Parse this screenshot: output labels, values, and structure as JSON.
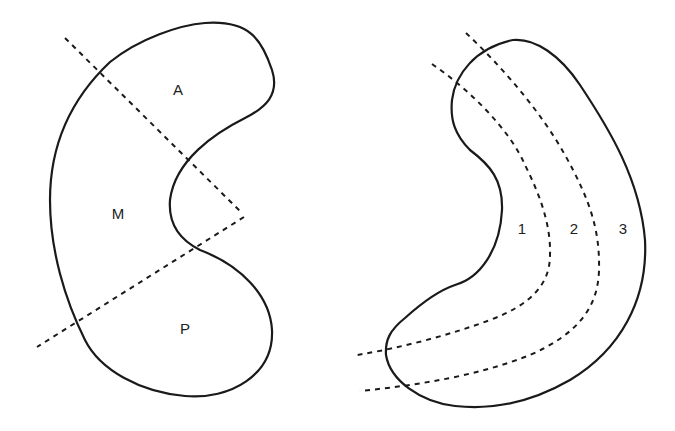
{
  "figures": [
    {
      "id": "left",
      "description": "Kidney-shaped region divided by two dashed lines into three zones",
      "labels": [
        {
          "text": "A",
          "x": 178,
          "y": 95
        },
        {
          "text": "M",
          "x": 118,
          "y": 219
        },
        {
          "text": "P",
          "x": 185,
          "y": 334
        }
      ]
    },
    {
      "id": "right",
      "description": "Curved region divided by two curved dashed lines into three bands",
      "labels": [
        {
          "text": "1",
          "x": 522,
          "y": 234
        },
        {
          "text": "2",
          "x": 574,
          "y": 234
        },
        {
          "text": "3",
          "x": 623,
          "y": 234
        }
      ]
    }
  ],
  "colors": {
    "stroke": "#1a1a1a",
    "background": "#ffffff"
  }
}
